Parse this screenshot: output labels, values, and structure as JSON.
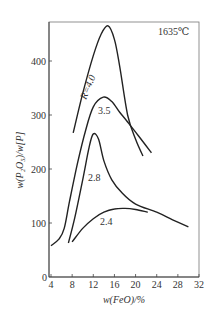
{
  "chart_data": {
    "type": "line",
    "title": "",
    "annotation": "1635℃",
    "xlabel": "w(FeO)/%",
    "ylabel": "w(P₂O₅)/w[P]",
    "xlim": [
      4,
      32
    ],
    "ylim": [
      0,
      480
    ],
    "xticks": [
      4,
      8,
      12,
      16,
      20,
      24,
      28,
      32
    ],
    "yticks": [
      0,
      100,
      200,
      300,
      400
    ],
    "grid": false,
    "legend": "inline curve labels",
    "series": [
      {
        "name": "R=4.0",
        "label": "R=4.0",
        "points": [
          [
            8.2,
            267
          ],
          [
            10,
            340
          ],
          [
            12,
            410
          ],
          [
            13.5,
            450
          ],
          [
            14.8,
            465
          ],
          [
            16,
            440
          ],
          [
            17,
            390
          ],
          [
            18.5,
            300
          ],
          [
            20,
            255
          ],
          [
            21.4,
            224
          ]
        ]
      },
      {
        "name": "R=3.5",
        "label": "3.5",
        "points": [
          [
            4,
            58
          ],
          [
            5.5,
            70
          ],
          [
            6.5,
            90
          ],
          [
            7.5,
            140
          ],
          [
            9,
            210
          ],
          [
            10.5,
            270
          ],
          [
            12,
            315
          ],
          [
            13.9,
            333
          ],
          [
            15.5,
            325
          ],
          [
            17,
            305
          ],
          [
            18.5,
            287
          ],
          [
            20.5,
            262
          ],
          [
            23,
            230
          ]
        ]
      },
      {
        "name": "R=2.8",
        "label": "2.8",
        "points": [
          [
            7.3,
            63
          ],
          [
            8.5,
            110
          ],
          [
            10,
            180
          ],
          [
            11.2,
            240
          ],
          [
            12,
            265
          ],
          [
            13,
            255
          ],
          [
            14,
            215
          ],
          [
            15.5,
            180
          ],
          [
            17.5,
            155
          ],
          [
            20,
            135
          ],
          [
            24,
            120
          ],
          [
            27,
            106
          ],
          [
            30,
            93
          ]
        ]
      },
      {
        "name": "R=2.4",
        "label": "2.4",
        "points": [
          [
            8,
            65
          ],
          [
            10,
            90
          ],
          [
            12,
            108
          ],
          [
            14,
            120
          ],
          [
            16,
            126
          ],
          [
            18,
            127
          ],
          [
            20,
            125
          ],
          [
            22.3,
            120
          ]
        ]
      }
    ]
  },
  "labels": {
    "annotation": "1635℃",
    "xlabel": "w(FeO)/%",
    "ylabel": "w(P₂O₅)/w[P]",
    "curves": [
      "R=4.0",
      "3.5",
      "2.8",
      "2.4"
    ],
    "xticks": [
      "4",
      "8",
      "12",
      "16",
      "20",
      "24",
      "28",
      "32"
    ],
    "yticks": [
      "0",
      "100",
      "200",
      "300",
      "400"
    ]
  }
}
